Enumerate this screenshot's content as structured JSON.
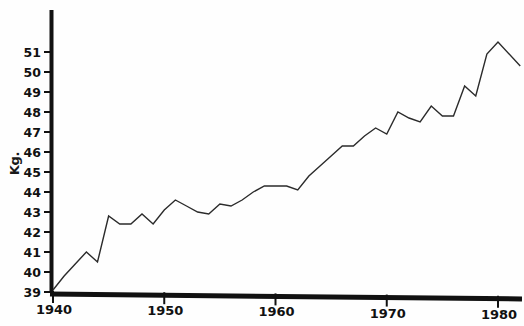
{
  "chart_data": {
    "type": "line",
    "title": "",
    "xlabel": "",
    "ylabel": "Kg.",
    "xlim": [
      1940,
      1982
    ],
    "ylim": [
      39,
      51.8
    ],
    "grid": false,
    "legend": null,
    "yticks": [
      39,
      40,
      41,
      42,
      43,
      44,
      45,
      46,
      47,
      48,
      49,
      50,
      51
    ],
    "ytick_labels": [
      "39",
      "40",
      "41",
      "42",
      "43",
      "44",
      "45",
      "46",
      "47",
      "48",
      "49",
      "50",
      "51"
    ],
    "xticks": [
      1940,
      1950,
      1960,
      1970,
      1980
    ],
    "xtick_labels": [
      "1940",
      "1950",
      "1960",
      "1970",
      "1980"
    ],
    "x": [
      1940,
      1941,
      1942,
      1943,
      1944,
      1945,
      1946,
      1947,
      1948,
      1949,
      1950,
      1951,
      1952,
      1953,
      1954,
      1955,
      1956,
      1957,
      1958,
      1959,
      1960,
      1961,
      1962,
      1963,
      1964,
      1965,
      1966,
      1967,
      1968,
      1969,
      1970,
      1971,
      1972,
      1973,
      1974,
      1975,
      1976,
      1977,
      1978,
      1979,
      1980,
      1982
    ],
    "values": [
      39.1,
      39.8,
      40.4,
      41.0,
      40.5,
      42.8,
      42.4,
      42.4,
      42.9,
      42.4,
      43.1,
      43.6,
      43.3,
      43.0,
      42.9,
      43.4,
      43.3,
      43.6,
      44.0,
      44.3,
      44.3,
      44.3,
      44.1,
      44.8,
      45.3,
      45.8,
      46.3,
      46.3,
      46.8,
      47.2,
      46.9,
      48.0,
      47.7,
      47.5,
      48.3,
      47.8,
      47.8,
      49.3,
      48.8,
      50.9,
      51.5,
      50.3
    ],
    "series_name": "",
    "line_color": "#2b2b2b",
    "axis_color": "#111111"
  },
  "axis": {
    "y_axis_title": "Kg.",
    "y_tick_labels": [
      "51",
      "50",
      "49",
      "48",
      "47",
      "46",
      "45",
      "44",
      "43",
      "42",
      "41",
      "40",
      "39"
    ],
    "x_tick_labels": [
      "1940",
      "1950",
      "1960",
      "1970",
      "1980"
    ]
  }
}
